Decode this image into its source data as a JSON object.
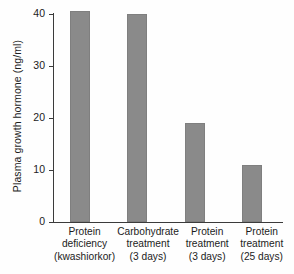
{
  "chart_data": {
    "type": "bar",
    "title": "",
    "xlabel": "",
    "ylabel": "Plasma growth hormone (ng/ml)",
    "ylim": [
      0,
      42
    ],
    "ytick_values": [
      0,
      10,
      20,
      30,
      40
    ],
    "ytick_labels": [
      "0",
      "10",
      "20",
      "30",
      "40"
    ],
    "grid": false,
    "legend": false,
    "bar_color": "#8a8a8a",
    "axis_color": "#3b3b3b",
    "background_color": "#fefefe",
    "categories": [
      "Protein deficiency (kwashiorkor)",
      "Carbohydrate treatment (3 days)",
      "Protein treatment (3 days)",
      "Protein treatment (25 days)"
    ],
    "category_label_lines": [
      [
        "Protein",
        "deficiency",
        "(kwashiorkor)"
      ],
      [
        "Carbohydrate",
        "treatment",
        "(3 days)"
      ],
      [
        "Protein",
        "treatment",
        "(3 days)"
      ],
      [
        "Protein",
        "treatment",
        "(25 days)"
      ]
    ],
    "values": [
      40.5,
      40.0,
      19.0,
      11.0
    ]
  }
}
